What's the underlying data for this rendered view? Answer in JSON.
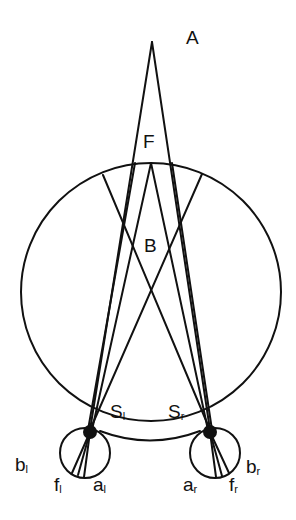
{
  "diagram": {
    "type": "binocular-vision-geometry",
    "labels": {
      "A": "A",
      "F": "F",
      "B": "B",
      "S_left": {
        "main": "S",
        "sub": "l"
      },
      "S_right": {
        "main": "S",
        "sub": "r"
      },
      "b_left": {
        "main": "b",
        "sub": "l"
      },
      "f_left": {
        "main": "f",
        "sub": "l"
      },
      "a_left": {
        "main": "a",
        "sub": "l"
      },
      "a_right": {
        "main": "a",
        "sub": "r"
      },
      "f_right": {
        "main": "f",
        "sub": "r"
      },
      "b_right": {
        "main": "b",
        "sub": "r"
      }
    },
    "colors": {
      "stroke": "#111111",
      "background": "#ffffff"
    }
  }
}
